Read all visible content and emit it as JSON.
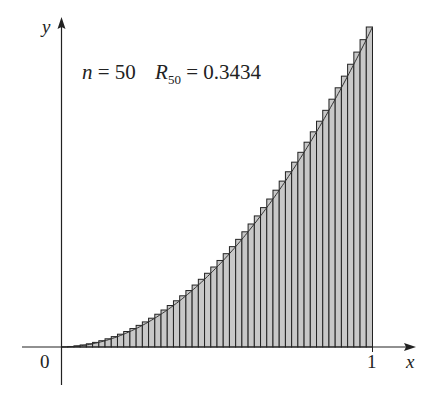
{
  "chart_data": {
    "type": "bar",
    "title": "n = 50   R50 = 0.3434",
    "function": "y = x^2",
    "method": "right endpoint Riemann sum",
    "n": 50,
    "R_value": 0.3434,
    "xlabel": "x",
    "ylabel": "y",
    "x_ticks": [
      "0",
      "1"
    ],
    "xlim": [
      0,
      1
    ],
    "ylim": [
      0,
      1
    ],
    "grid": false,
    "legend": null,
    "bar_fill": "#c8c8c8",
    "bar_stroke": "#222222"
  },
  "labels": {
    "y_axis": "y",
    "x_axis": "x",
    "origin": "0",
    "x_one": "1",
    "n_text": "n",
    "n_eq": " = 50",
    "R_text": "R",
    "R_sub": "50",
    "R_eq": " = 0.3434"
  }
}
